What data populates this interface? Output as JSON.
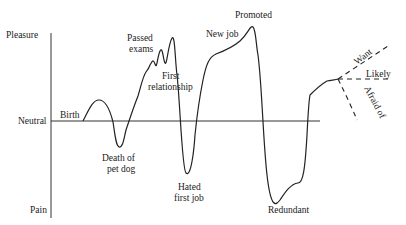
{
  "axis": {
    "top_label": "Pleasure",
    "middle_label": "Neutral",
    "bottom_label": "Pain"
  },
  "events": {
    "birth": "Birth",
    "death_pet_1": "Death of",
    "death_pet_2": "pet dog",
    "passed_1": "Passed",
    "passed_2": "exams",
    "first_rel_1": "First",
    "first_rel_2": "relationship",
    "hated_1": "Hated",
    "hated_2": "first job",
    "new_job": "New job",
    "promoted": "Promoted",
    "redundant": "Redundant"
  },
  "futures": {
    "want": "Want",
    "likely": "Likely",
    "afraid": "Afraid of"
  }
}
